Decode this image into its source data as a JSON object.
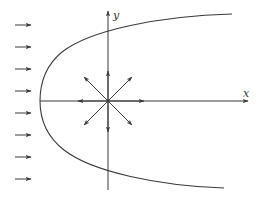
{
  "diagram": {
    "axes": {
      "x_label": "x",
      "y_label": "y",
      "origin": [
        108,
        101
      ]
    },
    "colors": {
      "line": "#3a3a3a",
      "background": "#ffffff"
    },
    "incoming_flow_arrows": {
      "count": 8,
      "x_start": 15,
      "x_end": 31,
      "y_positions": [
        25,
        47,
        69,
        91,
        113,
        135,
        157,
        179
      ]
    },
    "source_arrows": {
      "directions": [
        "up",
        "down",
        "left",
        "right",
        "up-left",
        "up-right",
        "down-left",
        "down-right"
      ]
    },
    "dividing_streamline": {
      "shape": "parabola",
      "vertex": [
        40,
        101
      ],
      "upper_end": [
        232,
        14
      ],
      "lower_end": [
        224,
        188
      ]
    }
  }
}
